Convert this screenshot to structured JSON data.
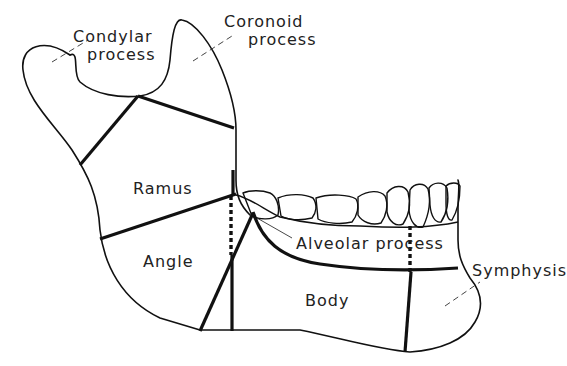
{
  "diagram": {
    "labels": {
      "condylar_process_line1": "Condylar",
      "condylar_process_line2": "process",
      "coronoid_process_line1": "Coronoid",
      "coronoid_process_line2": "process",
      "ramus": "Ramus",
      "angle": "Angle",
      "alveolar_process": "Alveolar process",
      "body": "Body",
      "symphysis": "Symphysis"
    },
    "colors": {
      "line": "#111111",
      "background": "#ffffff",
      "text": "#222222"
    }
  }
}
